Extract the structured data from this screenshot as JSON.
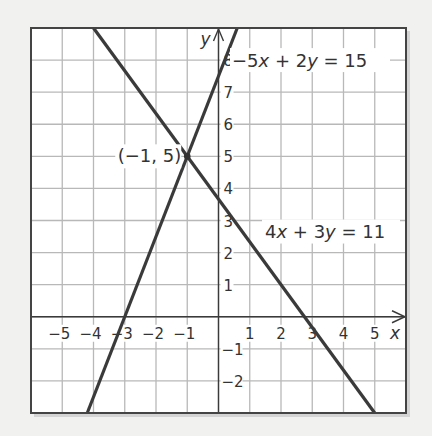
{
  "chart_data": {
    "type": "line",
    "title": "",
    "xlabel": "x",
    "ylabel": "y",
    "xlim": [
      -6,
      6
    ],
    "ylim": [
      -3,
      9
    ],
    "grid": true,
    "x_ticks": [
      "−5",
      "−4",
      "−3",
      "−2",
      "−1",
      "1",
      "2",
      "3",
      "4",
      "5"
    ],
    "x_tick_values": [
      -5,
      -4,
      -3,
      -2,
      -1,
      1,
      2,
      3,
      4,
      5
    ],
    "y_ticks": [
      "8",
      "7",
      "6",
      "5",
      "4",
      "3",
      "2",
      "1",
      "−1",
      "−2"
    ],
    "y_tick_values": [
      8,
      7,
      6,
      5,
      4,
      3,
      2,
      1,
      -1,
      -2
    ],
    "series": [
      {
        "name": "−5x + 2y = 15",
        "equation": "y = 2.5x + 7.5",
        "slope": 2.5,
        "intercept": 7.5,
        "points": [
          [
            -4.2,
            -3
          ],
          [
            -3,
            0
          ],
          [
            -1,
            5
          ],
          [
            0,
            7.5
          ],
          [
            0.6,
            9
          ]
        ]
      },
      {
        "name": "4x + 3y = 11",
        "equation": "y = (11 − 4x)/3",
        "slope": -1.3333,
        "intercept": 3.6667,
        "points": [
          [
            -4,
            9
          ],
          [
            -1,
            5
          ],
          [
            0,
            3.667
          ],
          [
            2.75,
            0
          ],
          [
            5,
            -3
          ]
        ]
      }
    ],
    "annotations": [
      {
        "text": "(−1, 5)",
        "x": -1,
        "y": 5,
        "type": "intersection-point"
      },
      {
        "text": "−5x + 2y = 15",
        "anchor_x": 0.3,
        "anchor_y": 8
      },
      {
        "text": "4x + 3y = 11",
        "anchor_x": 1.5,
        "anchor_y": 2.5
      }
    ]
  },
  "labels": {
    "x_axis": "x",
    "y_axis": "y",
    "intersection": "(−1, 5)",
    "eq1_part1": "−5",
    "eq1_var1": "x",
    "eq1_part2": " + 2",
    "eq1_var2": "y",
    "eq1_part3": " = 15",
    "eq2_part1": "4",
    "eq2_var1": "x",
    "eq2_part2": " + 3",
    "eq2_var2": "y",
    "eq2_part3": " = 11"
  },
  "colors": {
    "line": "#3a3a3a",
    "grid": "#b8b8b8",
    "frame": "#444444",
    "background": "#ffffff",
    "page": "#f1f1f0"
  }
}
